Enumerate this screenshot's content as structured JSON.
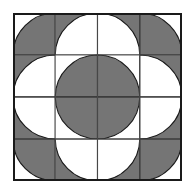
{
  "figure": {
    "canvas": {
      "width": 196,
      "height": 194,
      "background": "#ffffff"
    },
    "frame": {
      "x": 13,
      "y": 13,
      "width": 169,
      "height": 168,
      "border_color": "#1a1a1a",
      "border_width": 2
    },
    "grid": {
      "columns": 4,
      "rows": 4,
      "line_color": "#4d4d4d",
      "line_width": 0.9,
      "show_grid": true
    },
    "palette": {
      "gray": "#757575",
      "white": "#ffffff",
      "outline": "#1a1a1a",
      "gridline": "#4d4d4d"
    },
    "tiles": [
      {
        "row": 0,
        "col": 0,
        "background": "white",
        "arc_fill": "gray",
        "corner": "bottom-right"
      },
      {
        "row": 0,
        "col": 1,
        "background": "gray",
        "arc_fill": "white",
        "corner": "bottom-right"
      },
      {
        "row": 0,
        "col": 2,
        "background": "gray",
        "arc_fill": "white",
        "corner": "bottom-left"
      },
      {
        "row": 0,
        "col": 3,
        "background": "white",
        "arc_fill": "gray",
        "corner": "bottom-left"
      },
      {
        "row": 1,
        "col": 0,
        "background": "gray",
        "arc_fill": "white",
        "corner": "bottom-right"
      },
      {
        "row": 1,
        "col": 1,
        "background": "white",
        "arc_fill": "gray",
        "corner": "bottom-right"
      },
      {
        "row": 1,
        "col": 2,
        "background": "white",
        "arc_fill": "gray",
        "corner": "bottom-left"
      },
      {
        "row": 1,
        "col": 3,
        "background": "gray",
        "arc_fill": "white",
        "corner": "bottom-left"
      },
      {
        "row": 2,
        "col": 0,
        "background": "gray",
        "arc_fill": "white",
        "corner": "top-right"
      },
      {
        "row": 2,
        "col": 1,
        "background": "white",
        "arc_fill": "gray",
        "corner": "top-right"
      },
      {
        "row": 2,
        "col": 2,
        "background": "white",
        "arc_fill": "gray",
        "corner": "top-left"
      },
      {
        "row": 2,
        "col": 3,
        "background": "gray",
        "arc_fill": "white",
        "corner": "top-left"
      },
      {
        "row": 3,
        "col": 0,
        "background": "white",
        "arc_fill": "gray",
        "corner": "top-right"
      },
      {
        "row": 3,
        "col": 1,
        "background": "gray",
        "arc_fill": "white",
        "corner": "top-right"
      },
      {
        "row": 3,
        "col": 2,
        "background": "gray",
        "arc_fill": "white",
        "corner": "top-left"
      },
      {
        "row": 3,
        "col": 3,
        "background": "white",
        "arc_fill": "gray",
        "corner": "top-left"
      }
    ]
  }
}
